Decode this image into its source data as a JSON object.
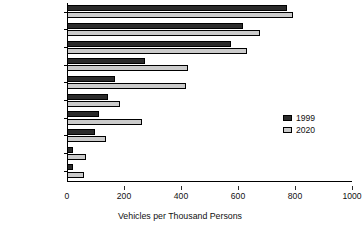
{
  "chart_data": {
    "type": "bar",
    "orientation": "horizontal",
    "title": "",
    "xlabel": "Vehicles per Thousand Persons",
    "ylabel": "",
    "xlim": [
      0,
      1000
    ],
    "xticks": [
      0,
      200,
      400,
      600,
      800,
      1000
    ],
    "grid": false,
    "legend_position": "center-right",
    "categories": [
      "United States",
      "Canada",
      "Japan",
      "South Korea",
      "Mexico",
      "FSU",
      "Brazil",
      "Turkey",
      "China",
      "India"
    ],
    "series": [
      {
        "name": "1999",
        "color": "#2b2b2b",
        "values": [
          771,
          616,
          574,
          275,
          169,
          144,
          113,
          99,
          20,
          22
        ]
      },
      {
        "name": "2020",
        "color": "#cbcbcb",
        "values": [
          792,
          676,
          633,
          426,
          416,
          187,
          264,
          137,
          67,
          60
        ]
      }
    ]
  },
  "legend": {
    "items": [
      {
        "label": "1999",
        "color": "#2b2b2b"
      },
      {
        "label": "2020",
        "color": "#cbcbcb"
      }
    ]
  }
}
